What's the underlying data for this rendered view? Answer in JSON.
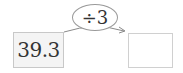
{
  "diagram": {
    "input_value": "39.3",
    "operation": "÷3",
    "output_value": "",
    "arrow": "arrow-right"
  },
  "colors": {
    "box_border": "#c8c8c8",
    "box_fill": "#f4f4f4",
    "ellipse_border": "#9a9a9a",
    "text": "#333333"
  }
}
